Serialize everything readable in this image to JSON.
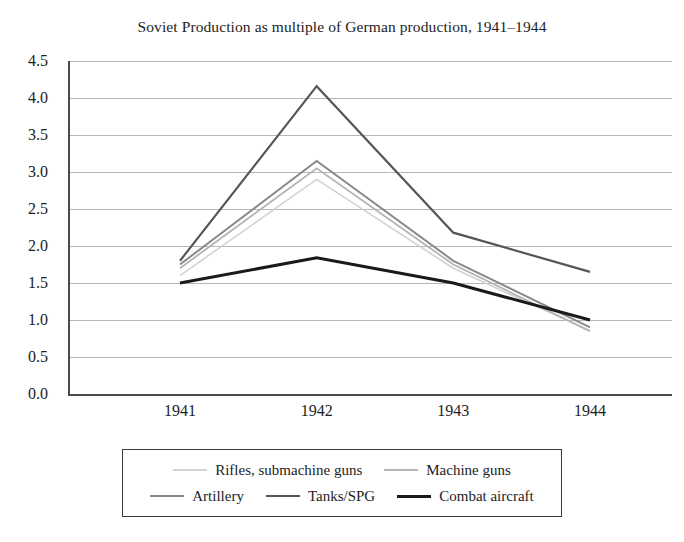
{
  "chart_data": {
    "type": "line",
    "title": "Soviet Production as multiple of German production, 1941–1944",
    "xlabel": "",
    "ylabel": "",
    "categories": [
      "1941",
      "1942",
      "1943",
      "1944"
    ],
    "ylim": [
      0.0,
      4.5
    ],
    "yticks": [
      "4.5",
      "4.0",
      "3.5",
      "3.0",
      "2.5",
      "2.0",
      "1.5",
      "1.0",
      "0.5",
      "0.0"
    ],
    "ytick_values": [
      4.5,
      4.0,
      3.5,
      3.0,
      2.5,
      2.0,
      1.5,
      1.0,
      0.5,
      0.0
    ],
    "grid": true,
    "legend_position": "bottom",
    "series": [
      {
        "name": "Rifles, submachine guns",
        "values": [
          1.6,
          2.9,
          1.7,
          0.85
        ],
        "color": "#d2d2d2",
        "width": 1.6
      },
      {
        "name": "Machine guns",
        "values": [
          1.7,
          3.05,
          1.75,
          0.85
        ],
        "color": "#b4b4b4",
        "width": 1.8
      },
      {
        "name": "Artillery",
        "values": [
          1.75,
          3.15,
          1.8,
          0.9
        ],
        "color": "#8a8a8a",
        "width": 2.0
      },
      {
        "name": "Tanks/SPG",
        "values": [
          1.8,
          4.16,
          2.18,
          1.65
        ],
        "color": "#565656",
        "width": 2.2
      },
      {
        "name": "Combat aircraft",
        "values": [
          1.5,
          1.84,
          1.5,
          1.0
        ],
        "color": "#1a1a1a",
        "width": 3.0
      }
    ]
  },
  "legend": {
    "rows": [
      [
        "Rifles, submachine guns",
        "Machine guns"
      ],
      [
        "Artillery",
        "Tanks/SPG",
        "Combat aircraft"
      ]
    ]
  }
}
